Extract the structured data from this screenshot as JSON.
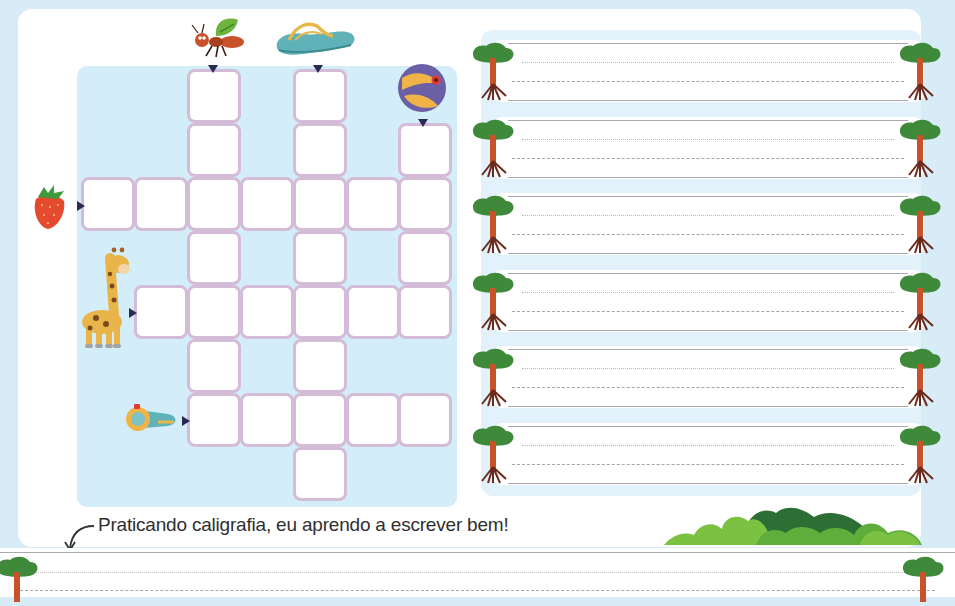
{
  "page": {
    "caption": "Praticando caligrafia, eu aprendo a escrever bem!",
    "colors": {
      "background": "#d8ecf7",
      "grid_background": "#d3eef9",
      "cell_border": "#d4bcd8",
      "arrow": "#2b2a55",
      "tree_foliage": "#3e8a3a",
      "tree_trunk": "#c9522a"
    }
  },
  "crossword": {
    "clues": [
      {
        "icon": "ant-icon",
        "direction": "down",
        "column": 2,
        "start_row": 0,
        "length": 7
      },
      {
        "icon": "flip-flop-icon",
        "direction": "down",
        "column": 4,
        "start_row": 0,
        "length": 8
      },
      {
        "icon": "beach-ball-icon",
        "direction": "down",
        "column": 6,
        "start_row": 1,
        "length": 4
      },
      {
        "icon": "strawberry-icon",
        "direction": "across",
        "row": 2,
        "start_col": 0,
        "length": 7
      },
      {
        "icon": "giraffe-icon",
        "direction": "across",
        "row": 4,
        "start_col": 1,
        "length": 6
      },
      {
        "icon": "whistle-icon",
        "direction": "across",
        "row": 6,
        "start_col": 2,
        "length": 5
      }
    ],
    "cells": [
      [
        0,
        2
      ],
      [
        0,
        4
      ],
      [
        1,
        2
      ],
      [
        1,
        4
      ],
      [
        1,
        6
      ],
      [
        2,
        0
      ],
      [
        2,
        1
      ],
      [
        2,
        2
      ],
      [
        2,
        3
      ],
      [
        2,
        4
      ],
      [
        2,
        5
      ],
      [
        2,
        6
      ],
      [
        3,
        2
      ],
      [
        3,
        4
      ],
      [
        3,
        6
      ],
      [
        4,
        1
      ],
      [
        4,
        2
      ],
      [
        4,
        3
      ],
      [
        4,
        4
      ],
      [
        4,
        5
      ],
      [
        4,
        6
      ],
      [
        5,
        2
      ],
      [
        5,
        4
      ],
      [
        6,
        2
      ],
      [
        6,
        3
      ],
      [
        6,
        4
      ],
      [
        6,
        5
      ],
      [
        6,
        6
      ],
      [
        7,
        4
      ]
    ]
  },
  "handwriting": {
    "strip_count": 6,
    "decoration": "tree-icon"
  }
}
